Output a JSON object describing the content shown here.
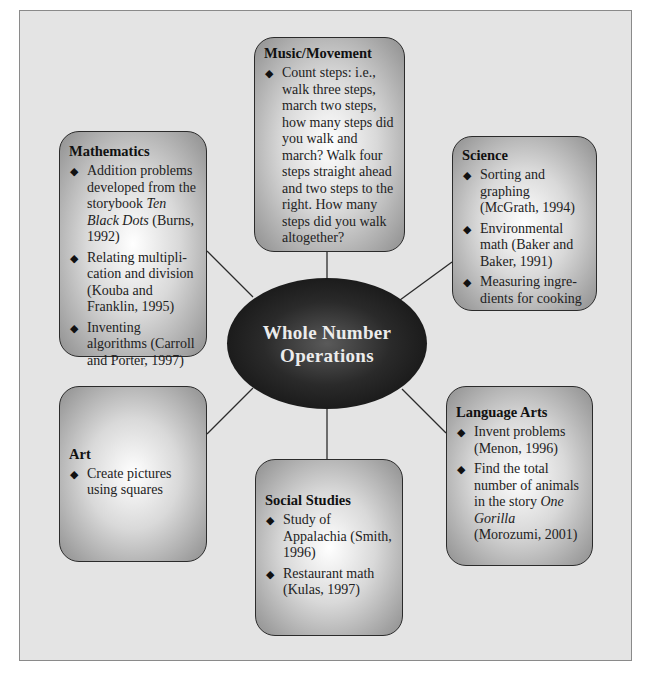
{
  "diagram": {
    "type": "concept-web",
    "hub": {
      "line1": "Whole Number",
      "line2": "Operations"
    },
    "nodes": {
      "music": {
        "title": "Music/Movement",
        "items": [
          {
            "text": "Count steps: i.e., walk three steps, march two steps, how many steps did you walk and march? Walk four steps straight ahead and two steps to the right. How many steps did you walk altogether?"
          }
        ]
      },
      "mathematics": {
        "title": "Mathematics",
        "items": [
          {
            "pre": "Addition problems developed from the storybook ",
            "italic": "Ten Black Dots",
            "post": " (Burns, 1992)"
          },
          {
            "text": "Relating multipli-cation and division (Kouba and Franklin, 1995)"
          },
          {
            "text": "Inventing algorithms (Carroll and Porter, 1997)"
          }
        ]
      },
      "science": {
        "title": "Science",
        "items": [
          {
            "text": "Sorting and graphing (McGrath, 1994)"
          },
          {
            "text": "Environmental math (Baker and Baker, 1991)"
          },
          {
            "text": "Measuring ingre-dients for cooking"
          }
        ]
      },
      "art": {
        "title": "Art",
        "items": [
          {
            "text": "Create pictures using squares"
          }
        ]
      },
      "social_studies": {
        "title": "Social Studies",
        "items": [
          {
            "text": "Study of Appalachia (Smith, 1996)"
          },
          {
            "text": "Restaurant math (Kulas, 1997)"
          }
        ]
      },
      "language_arts": {
        "title": "Language Arts",
        "items": [
          {
            "text": "Invent problems (Menon, 1996)"
          },
          {
            "pre": "Find the total number of animals in the story ",
            "italic": "One Gorilla",
            "post": " (Morozumi, 2001)"
          }
        ]
      }
    },
    "bullet_glyph": "◆",
    "colors": {
      "frame_bg": "#e4e4e4",
      "frame_border": "#8a8a8a",
      "node_border": "#2b2b2b",
      "hub_fill": "#0b0b0b",
      "hub_text": "#ececec",
      "link": "#2b2b2b"
    }
  },
  "caption": {
    "text": ""
  }
}
